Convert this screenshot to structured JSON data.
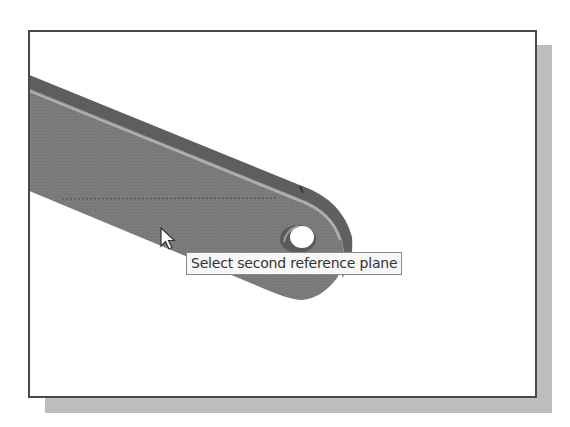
{
  "viewport": {
    "background": "#ffffff",
    "border_color": "#4a4a4a",
    "shadow_color": "#bdbdbd"
  },
  "model": {
    "part": "flat link bar with rounded end and through-hole",
    "face_color": "#7a7a7a",
    "top_edge_color": "#5e5e5e",
    "highlight_color": "#aaaaaa"
  },
  "cursor": {
    "icon": "arrow-pointer-icon"
  },
  "tooltip": {
    "text": "Select second reference plane"
  }
}
